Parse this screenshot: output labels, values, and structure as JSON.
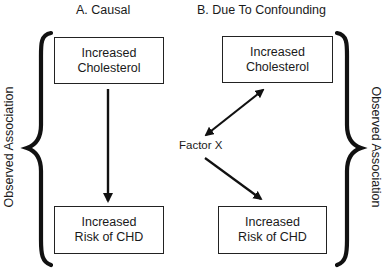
{
  "panels": {
    "a": {
      "title": "A. Causal",
      "top_box": {
        "line1": "Increased",
        "line2": "Cholesterol"
      },
      "bottom_box": {
        "line1": "Increased",
        "line2": "Risk of CHD"
      },
      "arrow": "top-to-bottom"
    },
    "b": {
      "title": "B. Due To Confounding",
      "top_box": {
        "line1": "Increased",
        "line2": "Cholesterol"
      },
      "bottom_box": {
        "line1": "Increased",
        "line2": "Risk of CHD"
      },
      "confounder": "Factor X",
      "arrows": [
        "Factor X <-> Increased Cholesterol",
        "Factor X -> Increased Risk of CHD"
      ]
    }
  },
  "side_labels": {
    "left": "Observed Association",
    "right": "Observed Association"
  },
  "colors": {
    "line": "#111111",
    "text": "#1a1a1a",
    "background": "#ffffff"
  }
}
